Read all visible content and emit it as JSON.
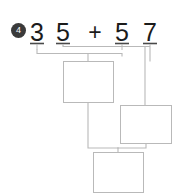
{
  "exercise": {
    "number": "4",
    "marker_name": "numbered-bullet"
  },
  "problem": {
    "expression": "35 + 57",
    "operand_left": "35",
    "operand_right": "57",
    "operator": "+",
    "digits": [
      {
        "value": "3",
        "place": "tens",
        "operand": "left",
        "x": 37
      },
      {
        "value": "5",
        "place": "ones",
        "operand": "left",
        "x": 63
      },
      {
        "value": "5",
        "place": "tens",
        "operand": "right",
        "x": 122
      },
      {
        "value": "7",
        "place": "ones",
        "operand": "right",
        "x": 150
      }
    ]
  },
  "operator_symbol": {
    "glyph": "+",
    "x": 95
  },
  "answer_boxes": [
    {
      "id": "partial-sum-ones",
      "value": "",
      "x": 63,
      "y": 61,
      "w": 51,
      "h": 42
    },
    {
      "id": "partial-sum-tens",
      "value": "",
      "x": 120,
      "y": 105,
      "w": 52,
      "h": 39
    },
    {
      "id": "final-sum",
      "value": "",
      "x": 93,
      "y": 152,
      "w": 51,
      "h": 41
    }
  ],
  "colors": {
    "stroke": "#b9b9b9",
    "tick": "#4a4a4a",
    "digit": "#1b1b1b",
    "badge_bg": "#3a3a3a",
    "badge_fg": "#ffffff",
    "background": "#ffffff"
  }
}
